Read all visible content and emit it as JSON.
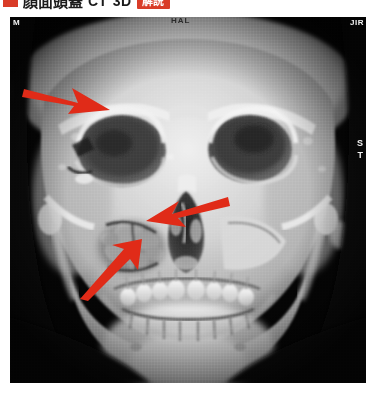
{
  "header": {
    "bullet_color": "#d93c28",
    "title": "顔面頭蓋",
    "modality": "CT",
    "render_mode": "3D",
    "badge_label": "解説",
    "badge_color": "#d93c28"
  },
  "ct_image": {
    "description": "3D volume-rendered CT reconstruction of the facial skeleton, frontal view",
    "background_color": "#050505",
    "bone_color": "#dcdcdc",
    "orientation_labels": [
      {
        "text": "M",
        "position": "top-left",
        "color": "#f2f2f2"
      },
      {
        "text": "HAL",
        "position": "top-center",
        "color": "#2a2a2a"
      },
      {
        "text": "JIR",
        "position": "top-right",
        "color": "#f2f2f2"
      },
      {
        "text": "S",
        "position": "right-upper",
        "color": "#f2f2f2"
      },
      {
        "text": "T",
        "position": "right-lower",
        "color": "#f2f2f2"
      }
    ],
    "annotations": [
      {
        "name": "arrow-left-orbit",
        "color": "#e02b18",
        "direction": "right",
        "x": 22,
        "y": 80,
        "width": 78,
        "height": 34
      },
      {
        "name": "arrow-maxilla",
        "color": "#e02b18",
        "direction": "left",
        "x": 146,
        "y": 192,
        "width": 70,
        "height": 32
      },
      {
        "name": "arrow-zygoma",
        "color": "#e02b18",
        "direction": "up-right",
        "x": 78,
        "y": 240,
        "width": 62,
        "height": 48
      }
    ]
  }
}
